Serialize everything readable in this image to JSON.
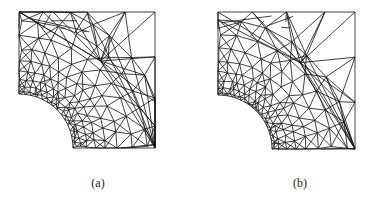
{
  "figure": {
    "panels": [
      {
        "id": "a",
        "label": "(a)",
        "description": "Triangular mesh of square plate with quarter-circle hole, dense band refinement along diagonal"
      },
      {
        "id": "b",
        "label": "(b)",
        "description": "Triangular mesh of square plate with quarter-circle hole, refinement concentrated near arc"
      }
    ],
    "colors": {
      "line": "#111111",
      "background": "#ffffff"
    }
  }
}
